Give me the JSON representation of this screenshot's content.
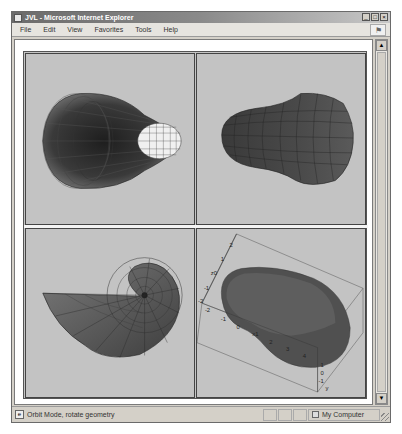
{
  "window": {
    "title": "JVL - Microsoft Internet Explorer",
    "buttons": {
      "minimize": "_",
      "maximize": "□",
      "close": "×"
    }
  },
  "menubar": {
    "items": [
      "File",
      "Edit",
      "View",
      "Favorites",
      "Tools",
      "Help"
    ],
    "logo_icon": "windows-flag-icon"
  },
  "scrollbar": {
    "up_arrow": "▲",
    "down_arrow": "▼"
  },
  "viewer": {
    "panes": [
      {
        "id": "top-left",
        "description": "Tapered tube viewed from open end, wireframe"
      },
      {
        "id": "top-right",
        "description": "Tapered tube viewed from side, shaded wireframe"
      },
      {
        "id": "bottom-left",
        "description": "Nautilus spiral shell, wireframe"
      },
      {
        "id": "bottom-right",
        "description": "Kidney-shaped surface in 3D bounding box with axes"
      }
    ],
    "axes_br": {
      "z_ticks": [
        "2",
        "1",
        "z0",
        "-1",
        "-2"
      ],
      "x_ticks": [
        "-2",
        "-1",
        "0",
        "x1",
        "2",
        "3",
        "4"
      ],
      "y_ticks": [
        "1",
        "0",
        "-1",
        "y"
      ]
    },
    "colors": {
      "pane_background": "#c3c3c3",
      "surface_dark": "#3c3c3c",
      "surface_mid": "#6a6a6a",
      "surface_light": "#e8e8e8"
    }
  },
  "statusbar": {
    "text": "Orbit Mode, rotate geometry",
    "zone": "My Computer"
  }
}
